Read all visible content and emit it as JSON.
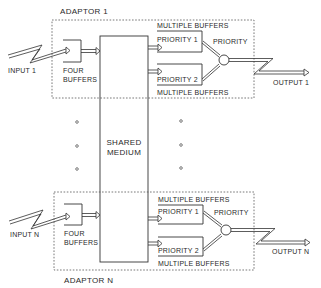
{
  "diagram": {
    "type": "block-diagram",
    "shared": {
      "label_line1": "SHARED",
      "label_line2": "MEDIUM"
    },
    "adaptors": [
      {
        "title": "ADAPTOR  1",
        "input_label": "INPUT 1",
        "output_label": "OUTPUT 1",
        "input_buffer": {
          "line1": "FOUR",
          "line2": "BUFFERS"
        },
        "top_caption": "MULTIPLE BUFFERS",
        "priority1": "PRIORITY 1",
        "priority2": "PRIORITY 2",
        "bottom_caption": "MULTIPLE BUFFERS",
        "mux_label": "PRIORITY"
      },
      {
        "title": "ADAPTOR  N",
        "input_label": "INPUT N",
        "output_label": "OUTPUT N",
        "input_buffer": {
          "line1": "FOUR",
          "line2": "BUFFERS"
        },
        "top_caption": "MULTIPLE BUFFERS",
        "priority1": "PRIORITY 1",
        "priority2": "PRIORITY 2",
        "bottom_caption": "MULTIPLE BUFFERS",
        "mux_label": "PRIORITY"
      }
    ],
    "ellipsis": "o"
  }
}
